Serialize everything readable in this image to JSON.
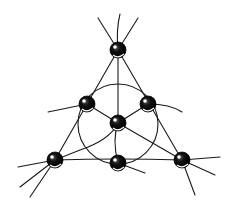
{
  "diagram": {
    "title": "",
    "colors": {
      "line": "#1a1a1a",
      "node": "#000000",
      "background": "#ffffff"
    },
    "nodes": [
      {
        "id": "top",
        "x": 118,
        "y": 50
      },
      {
        "id": "mid-left",
        "x": 87,
        "y": 104
      },
      {
        "id": "mid-right",
        "x": 148,
        "y": 104
      },
      {
        "id": "center",
        "x": 118,
        "y": 123
      },
      {
        "id": "bottom-left",
        "x": 55,
        "y": 160
      },
      {
        "id": "bottom-middle",
        "x": 118,
        "y": 163
      },
      {
        "id": "bottom-right",
        "x": 182,
        "y": 160
      }
    ],
    "circle": {
      "cx": 118,
      "cy": 124,
      "r": 40
    }
  }
}
